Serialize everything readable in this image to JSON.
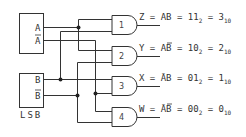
{
  "diagram": {
    "inputs": [
      {
        "id": "A",
        "box_label_true": "A",
        "box_label_complement": "A",
        "complement_bar": true
      },
      {
        "id": "B",
        "box_label_true": "B",
        "box_label_complement": "B",
        "complement_bar": true,
        "note": "LSB"
      }
    ],
    "lsb_label": "LSB",
    "gates": [
      {
        "number": "1",
        "output": "Z",
        "expr_left": "Z = AB =",
        "binary": "11",
        "binary_base": "2",
        "decimal_sep": "=",
        "decimal": "3",
        "decimal_base": "10",
        "inputs": [
          "A",
          "B"
        ]
      },
      {
        "number": "2",
        "output": "Y",
        "expr_left": "Y = AB =",
        "binary": "10",
        "binary_base": "2",
        "decimal_sep": "=",
        "decimal": "2",
        "decimal_base": "10",
        "inputs": [
          "A",
          "B̄"
        ]
      },
      {
        "number": "3",
        "output": "X",
        "expr_left": "X = ĀB =",
        "binary": "01",
        "binary_base": "2",
        "decimal_sep": "=",
        "decimal": "1",
        "decimal_base": "10",
        "inputs": [
          "Ā",
          "B"
        ]
      },
      {
        "number": "4",
        "output": "W",
        "expr_left": "W = ĀB =",
        "binary": "00",
        "binary_base": "2",
        "decimal_sep": "=",
        "decimal": "0",
        "decimal_base": "10",
        "inputs": [
          "Ā",
          "B̄"
        ]
      }
    ],
    "colors": {
      "line": "#333333",
      "background": "#ffffff"
    }
  }
}
